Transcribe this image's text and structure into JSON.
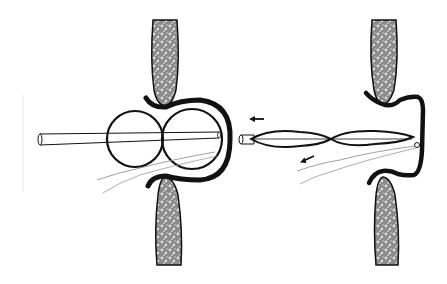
{
  "figure": {
    "panels": [
      {
        "id": "left",
        "label": "",
        "state": "inflated"
      },
      {
        "id": "right",
        "label": "",
        "state": "deflated-withdrawal"
      }
    ],
    "colors": {
      "background": "#ffffff",
      "stroke": "#111111",
      "tissue_fill": "#8a8a8a",
      "tissue_speckle": "#d8d8d8",
      "thread": "#888888"
    },
    "arrows": [
      {
        "panel": "right",
        "direction": "left",
        "target": "catheter"
      },
      {
        "panel": "right",
        "direction": "down-left",
        "target": "thread"
      }
    ]
  }
}
